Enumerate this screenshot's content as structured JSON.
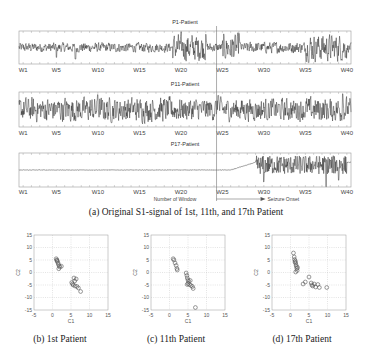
{
  "chart_data": [
    {
      "type": "line",
      "title": "P1-Patient",
      "x_tick_labels": [
        "W1",
        "W5",
        "W10",
        "W15",
        "W20",
        "W25",
        "W30",
        "W35",
        "W40"
      ],
      "x_ticks": [
        1,
        5,
        10,
        15,
        20,
        25,
        30,
        35,
        40
      ],
      "xlim": [
        0.5,
        40.5
      ],
      "ylim": [
        -1,
        1
      ],
      "grid": false,
      "signal_profile": {
        "baseline_amplitude": 0.25,
        "burst_windows": [
          [
            19,
            23
          ],
          [
            25,
            27
          ],
          [
            35,
            40
          ]
        ],
        "burst_amplitude": 0.7,
        "dense_windows": [
          [
            28,
            35
          ]
        ],
        "spikes": [
          {
            "x": 5,
            "y": -0.6
          },
          {
            "x": 7.3,
            "y": -0.7
          },
          {
            "x": 23,
            "y": 0.8
          },
          {
            "x": 27,
            "y": 0.85
          },
          {
            "x": 39.8,
            "y": -0.6
          }
        ]
      }
    },
    {
      "type": "line",
      "title": "P11-Patient",
      "x_tick_labels": [
        "W1",
        "W5",
        "W10",
        "W15",
        "W20",
        "W25",
        "W30",
        "W35",
        "W40"
      ],
      "x_ticks": [
        1,
        5,
        10,
        15,
        20,
        25,
        30,
        35,
        40
      ],
      "xlim": [
        0.5,
        40.5
      ],
      "ylim": [
        -1,
        1
      ],
      "grid": false,
      "signal_profile": {
        "baseline_amplitude": 0.55,
        "burst_windows": [
          [
            1,
            20
          ],
          [
            35,
            40
          ]
        ],
        "burst_amplitude": 0.6,
        "dense_windows": [
          [
            20,
            35
          ]
        ],
        "spikes": [
          {
            "x": 10,
            "y": 0.85
          },
          {
            "x": 24.5,
            "y": 0.8
          },
          {
            "x": 39.5,
            "y": 0.9
          }
        ]
      }
    },
    {
      "type": "line",
      "title": "P17-Patient",
      "xlabel": "Number of Window",
      "annotation": "Seizure Onset",
      "x_tick_labels": [
        "W1",
        "W5",
        "W10",
        "W15",
        "W20",
        "W25",
        "W30",
        "W35",
        "W40"
      ],
      "x_ticks": [
        1,
        5,
        10,
        15,
        20,
        25,
        30,
        35,
        40
      ],
      "xlim": [
        0.5,
        40.5
      ],
      "ylim": [
        -1,
        1
      ],
      "grid": false,
      "seizure_onset_window": 24.3,
      "signal_profile": {
        "baseline_amplitude": 0.03,
        "burst_windows": [
          [
            29,
            40
          ]
        ],
        "burst_amplitude": 0.55,
        "dense_windows": [],
        "spikes": [
          {
            "x": 30,
            "y": -0.7
          },
          {
            "x": 37.5,
            "y": -1.0
          },
          {
            "x": 39,
            "y": -0.6
          }
        ]
      }
    },
    {
      "type": "scatter",
      "title": "(b) 1st Patient",
      "xlabel": "C1",
      "ylabel": "C2",
      "xlim": [
        -5,
        15
      ],
      "ylim": [
        -15,
        15
      ],
      "x_ticks": [
        -5,
        0,
        5,
        10,
        15
      ],
      "y_ticks": [
        -15,
        -10,
        -5,
        0,
        5,
        10,
        15
      ],
      "grid": true,
      "points": [
        {
          "x": 1.0,
          "y": 5.5
        },
        {
          "x": 1.2,
          "y": 5.0
        },
        {
          "x": 1.3,
          "y": 4.4
        },
        {
          "x": 1.5,
          "y": 3.8
        },
        {
          "x": 1.6,
          "y": 3.2
        },
        {
          "x": 1.8,
          "y": 2.6
        },
        {
          "x": 2.0,
          "y": 2.2
        },
        {
          "x": 2.4,
          "y": 2.5
        },
        {
          "x": 1.7,
          "y": 1.5
        },
        {
          "x": 1.2,
          "y": 4.8
        },
        {
          "x": 5.8,
          "y": -2.2
        },
        {
          "x": 6.4,
          "y": -2.6
        },
        {
          "x": 6.0,
          "y": -3.4
        },
        {
          "x": 5.4,
          "y": -4.6
        },
        {
          "x": 5.6,
          "y": -5.0
        },
        {
          "x": 6.1,
          "y": -5.4
        },
        {
          "x": 6.6,
          "y": -5.6
        },
        {
          "x": 7.0,
          "y": -6.2
        },
        {
          "x": 7.6,
          "y": -7.6
        },
        {
          "x": 5.2,
          "y": -4.0
        }
      ]
    },
    {
      "type": "scatter",
      "title": "(c) 11th Patient",
      "xlabel": "C1",
      "ylabel": "C2",
      "xlim": [
        -5,
        15
      ],
      "ylim": [
        -15,
        15
      ],
      "x_ticks": [
        -5,
        0,
        5,
        10,
        15
      ],
      "y_ticks": [
        -15,
        -10,
        -5,
        0,
        5,
        10,
        15
      ],
      "grid": true,
      "points": [
        {
          "x": 1.0,
          "y": 5.5
        },
        {
          "x": 1.2,
          "y": 5.0
        },
        {
          "x": 1.5,
          "y": 3.8
        },
        {
          "x": 1.8,
          "y": 2.8
        },
        {
          "x": 2.0,
          "y": 1.6
        },
        {
          "x": 2.1,
          "y": 1.0
        },
        {
          "x": 4.5,
          "y": -0.2
        },
        {
          "x": 4.7,
          "y": -1.2
        },
        {
          "x": 4.8,
          "y": -2.2
        },
        {
          "x": 5.0,
          "y": -3.0
        },
        {
          "x": 5.2,
          "y": -3.6
        },
        {
          "x": 5.0,
          "y": -4.4
        },
        {
          "x": 5.4,
          "y": -4.8
        },
        {
          "x": 5.8,
          "y": -5.2
        },
        {
          "x": 6.2,
          "y": -5.6
        },
        {
          "x": 6.4,
          "y": -6.4
        },
        {
          "x": 4.8,
          "y": -4.8
        },
        {
          "x": 5.6,
          "y": -3.2
        },
        {
          "x": 7.0,
          "y": -14.0
        }
      ]
    },
    {
      "type": "scatter",
      "title": "(d) 17th Patient",
      "xlabel": "C1",
      "ylabel": "C2",
      "xlim": [
        -5,
        15
      ],
      "ylim": [
        -15,
        15
      ],
      "x_ticks": [
        -5,
        0,
        5,
        10,
        15
      ],
      "y_ticks": [
        -15,
        -10,
        -5,
        0,
        5,
        10,
        15
      ],
      "grid": true,
      "points": [
        {
          "x": 0.8,
          "y": 7.8
        },
        {
          "x": 1.0,
          "y": 6.2
        },
        {
          "x": 1.1,
          "y": 5.2
        },
        {
          "x": 1.3,
          "y": 4.6
        },
        {
          "x": 1.4,
          "y": 3.8
        },
        {
          "x": 1.5,
          "y": 3.0
        },
        {
          "x": 1.6,
          "y": 2.4
        },
        {
          "x": 1.7,
          "y": 1.6
        },
        {
          "x": 1.8,
          "y": 0.8
        },
        {
          "x": 1.4,
          "y": 0.2
        },
        {
          "x": 1.2,
          "y": 4.2
        },
        {
          "x": 1.9,
          "y": 2.0
        },
        {
          "x": 5.0,
          "y": -1.8
        },
        {
          "x": 3.4,
          "y": -4.6
        },
        {
          "x": 4.0,
          "y": -3.8
        },
        {
          "x": 5.6,
          "y": -4.2
        },
        {
          "x": 5.8,
          "y": -5.0
        },
        {
          "x": 6.0,
          "y": -5.4
        },
        {
          "x": 6.4,
          "y": -4.6
        },
        {
          "x": 7.4,
          "y": -4.8
        },
        {
          "x": 6.8,
          "y": -5.8
        },
        {
          "x": 7.8,
          "y": -6.0
        },
        {
          "x": 9.8,
          "y": -6.0
        }
      ]
    }
  ],
  "captions": {
    "top": "(a) Original S1-signal of 1st, 11th, and 17th Patient",
    "b": "(b) 1st Patient",
    "c": "(c) 11th Patient",
    "d": "(d) 17th Patient"
  }
}
